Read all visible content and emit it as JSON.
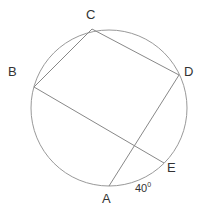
{
  "diagram": {
    "type": "circle-geometry",
    "circle": {
      "cx": 109,
      "cy": 108,
      "r": 78,
      "stroke": "#999999"
    },
    "points": {
      "A": {
        "label": "A",
        "x": 109,
        "y": 186
      },
      "B": {
        "label": "B",
        "x": 34,
        "y": 87
      },
      "C": {
        "label": "C",
        "x": 92,
        "y": 29
      },
      "D": {
        "label": "D",
        "x": 179,
        "y": 75
      },
      "E": {
        "label": "E",
        "x": 164,
        "y": 163
      }
    },
    "segments": [
      [
        "B",
        "C"
      ],
      [
        "C",
        "D"
      ],
      [
        "D",
        "A"
      ],
      [
        "B",
        "E"
      ]
    ],
    "annotations": [
      {
        "text": "40°",
        "near": "arc AE"
      }
    ],
    "angle_label": "40",
    "angle_sup": "0"
  }
}
